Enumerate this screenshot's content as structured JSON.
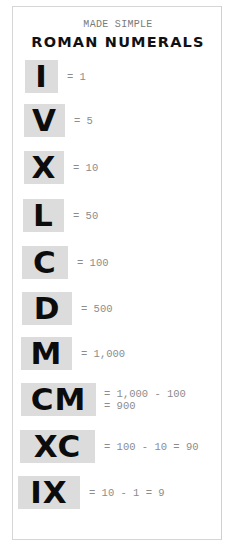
{
  "header": {
    "subtitle": "MADE SIMPLE",
    "title": "ROMAN NUMERALS"
  },
  "colors": {
    "box_background": "#dcdcdc",
    "numeral_text": "#0c0c0c",
    "equation_text": "#8c8c8c",
    "card_border": "#d6d6d6"
  },
  "numerals": [
    {
      "symbol": "I",
      "equation": "= 1"
    },
    {
      "symbol": "V",
      "equation": "= 5"
    },
    {
      "symbol": "X",
      "equation": "= 10"
    },
    {
      "symbol": "L",
      "equation": "= 50"
    },
    {
      "symbol": "C",
      "equation": "= 100"
    },
    {
      "symbol": "D",
      "equation": "= 500"
    },
    {
      "symbol": "M",
      "equation": "= 1,000"
    },
    {
      "symbol": "CM",
      "equation_line1": "= 1,000 - 100",
      "equation_line2": "= 900"
    },
    {
      "symbol": "XC",
      "equation": "= 100 - 10 = 90"
    },
    {
      "symbol": "IX",
      "equation": "= 10 - 1 = 9"
    }
  ]
}
